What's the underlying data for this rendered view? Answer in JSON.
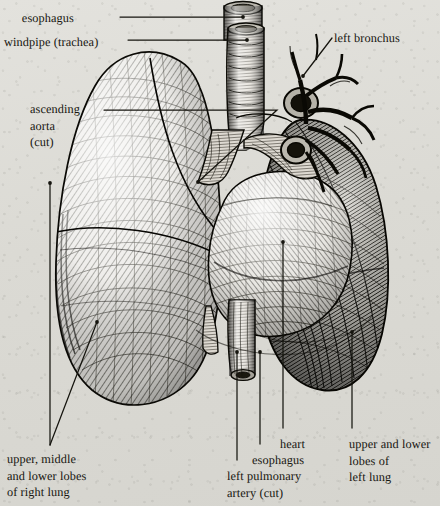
{
  "figure": {
    "style": "engraving",
    "paper_color": "#dddcd7",
    "ink_color": "#16150f"
  },
  "labels": [
    {
      "id": "esophagus-top",
      "text": "esophagus",
      "x": 74,
      "y": 10,
      "align": "right"
    },
    {
      "id": "windpipe-trachea",
      "text": "windpipe (trachea)",
      "x": 4,
      "y": 34,
      "align": "left"
    },
    {
      "id": "left-bronchus",
      "text": "left bronchus",
      "x": 334,
      "y": 30,
      "align": "left"
    },
    {
      "id": "ascending-aorta",
      "text": "ascending\naorta\n(cut)",
      "x": 30,
      "y": 101,
      "align": "left"
    },
    {
      "id": "right-lung-lobes",
      "text": "upper, middle\nand lower lobes\nof right lung",
      "x": 7,
      "y": 451,
      "align": "left"
    },
    {
      "id": "left-pulmonary-artery",
      "text": "left pulmonary\nartery (cut)",
      "x": 227,
      "y": 468,
      "align": "left"
    },
    {
      "id": "esophagus-bottom",
      "text": "esophagus",
      "x": 252,
      "y": 452,
      "align": "left"
    },
    {
      "id": "heart",
      "text": "heart",
      "x": 280,
      "y": 436,
      "align": "left"
    },
    {
      "id": "left-lung-lobes",
      "text": "upper and lower\nlobes of\nleft lung",
      "x": 349,
      "y": 436,
      "align": "left"
    }
  ],
  "leader_lines": [
    {
      "id": "leader-esophagus-top",
      "points": "120,17 243,17"
    },
    {
      "id": "leader-windpipe",
      "points": "128,40 247,40"
    },
    {
      "id": "leader-left-bronchus",
      "points": "332,38 303,76"
    },
    {
      "id": "leader-ascending-aorta",
      "points": "104,110 277,110 198,182"
    },
    {
      "id": "leader-right-lung-lobes-a",
      "points": "50,445 50,183"
    },
    {
      "id": "leader-right-lung-lobes-b",
      "points": "50,445 97,322"
    },
    {
      "id": "leader-left-pulmonary-artery",
      "points": "237,460 237,352"
    },
    {
      "id": "leader-esophagus-bottom",
      "points": "260,444 260,352"
    },
    {
      "id": "leader-heart",
      "points": "283,428 283,242"
    },
    {
      "id": "leader-left-lung-lobes",
      "points": "352,428 352,332"
    }
  ],
  "anatomy_parts": [
    {
      "id": "trachea",
      "name": "windpipe (trachea)"
    },
    {
      "id": "esophagus-upper",
      "name": "esophagus (upper, cut)"
    },
    {
      "id": "esophagus-lower",
      "name": "esophagus (lower, cut)"
    },
    {
      "id": "right-lung",
      "name": "right lung, upper middle and lower lobes"
    },
    {
      "id": "left-lung",
      "name": "left lung, upper and lower lobes"
    },
    {
      "id": "heart",
      "name": "heart"
    },
    {
      "id": "aortic-arch",
      "name": "ascending aorta (cut)"
    },
    {
      "id": "left-bronchus",
      "name": "left bronchus"
    },
    {
      "id": "pulmonary-vessel-cut-upper",
      "name": "cut vessel ring, upper"
    },
    {
      "id": "pulmonary-vessel-cut-lower",
      "name": "cut vessel ring, lower"
    },
    {
      "id": "left-pulmonary-artery",
      "name": "left pulmonary artery (cut)"
    }
  ]
}
